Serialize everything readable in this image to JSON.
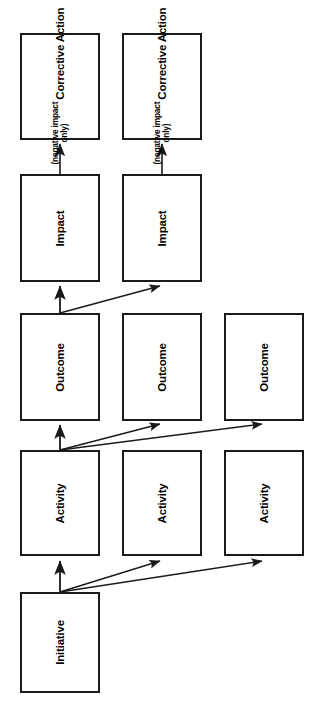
{
  "diagram": {
    "orientation": "rotated-90-ccw",
    "background_color": "#ffffff",
    "line_color": "#1a1a1a",
    "text_color": "#000000",
    "levels": [
      {
        "id": "corrective-action",
        "label": "Corrective Action",
        "sublabel_line1": "(negative impact",
        "sublabel_line2": "only)",
        "count": 2
      },
      {
        "id": "impact",
        "label": "Impact",
        "count": 2
      },
      {
        "id": "outcome",
        "label": "Outcome",
        "count": 3
      },
      {
        "id": "activity",
        "label": "Activity",
        "count": 3
      },
      {
        "id": "initiative",
        "label": "Initiative",
        "count": 1
      }
    ],
    "nodes": [
      {
        "key": "ca1",
        "label": "Corrective Action",
        "sub1": "(negative impact",
        "sub2": "only)",
        "x": 20,
        "y": 33,
        "w": 80,
        "h": 107
      },
      {
        "key": "ca2",
        "label": "Corrective Action",
        "sub1": "(negative impact",
        "sub2": "only)",
        "x": 122,
        "y": 33,
        "w": 80,
        "h": 107
      },
      {
        "key": "im1",
        "label": "Impact",
        "x": 20,
        "y": 174,
        "w": 80,
        "h": 108
      },
      {
        "key": "im2",
        "label": "Impact",
        "x": 122,
        "y": 174,
        "w": 80,
        "h": 108
      },
      {
        "key": "oc1",
        "label": "Outcome",
        "x": 20,
        "y": 313,
        "w": 80,
        "h": 108
      },
      {
        "key": "oc2",
        "label": "Outcome",
        "x": 122,
        "y": 313,
        "w": 80,
        "h": 108
      },
      {
        "key": "oc3",
        "label": "Outcome",
        "x": 224,
        "y": 313,
        "w": 80,
        "h": 108
      },
      {
        "key": "ac1",
        "label": "Activity",
        "x": 20,
        "y": 450,
        "w": 80,
        "h": 106
      },
      {
        "key": "ac2",
        "label": "Activity",
        "x": 122,
        "y": 450,
        "w": 80,
        "h": 106
      },
      {
        "key": "ac3",
        "label": "Activity",
        "x": 224,
        "y": 450,
        "w": 80,
        "h": 106
      },
      {
        "key": "in1",
        "label": "Initiative",
        "x": 20,
        "y": 592,
        "w": 80,
        "h": 101
      }
    ],
    "edges": [
      {
        "from": "im1",
        "to": "ca1",
        "type": "straight"
      },
      {
        "from": "im2",
        "to": "ca2",
        "type": "straight"
      },
      {
        "from": "oc1",
        "to": "im1",
        "type": "straight"
      },
      {
        "from": "oc1",
        "to": "im2",
        "type": "diagonal"
      },
      {
        "from": "ac1",
        "to": "oc1",
        "type": "straight"
      },
      {
        "from": "ac1",
        "to": "oc2",
        "type": "diagonal"
      },
      {
        "from": "ac1",
        "to": "oc3",
        "type": "diagonal"
      },
      {
        "from": "in1",
        "to": "ac1",
        "type": "straight"
      },
      {
        "from": "in1",
        "to": "ac2",
        "type": "diagonal"
      },
      {
        "from": "in1",
        "to": "ac3",
        "type": "diagonal"
      }
    ]
  }
}
